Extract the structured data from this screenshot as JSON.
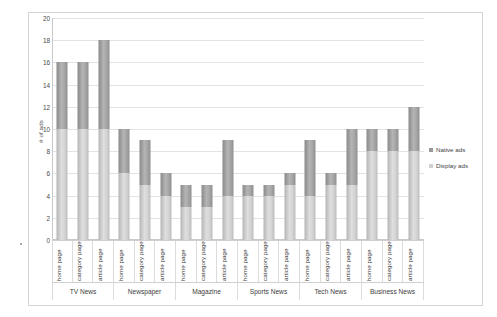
{
  "chart_data": {
    "type": "bar",
    "subtype": "stacked-bar-grouped",
    "title": "",
    "xlabel": "",
    "ylabel": "# of ads",
    "ylim": [
      0,
      20
    ],
    "yticks": [
      0,
      2,
      4,
      6,
      8,
      10,
      12,
      14,
      16,
      18,
      20
    ],
    "grid": true,
    "legend_position": "right",
    "categories": [
      "home page",
      "category page",
      "article page",
      "home page",
      "category page",
      "article page",
      "home page",
      "category page",
      "article page",
      "home page",
      "category page",
      "article page",
      "home page",
      "category page",
      "article page",
      "home page",
      "category page",
      "article page"
    ],
    "groups": [
      {
        "name": "TV News",
        "span": 3
      },
      {
        "name": "Newspaper",
        "span": 3
      },
      {
        "name": "Magazine",
        "span": 3
      },
      {
        "name": "Sports News",
        "span": 3
      },
      {
        "name": "Tech News",
        "span": 3
      },
      {
        "name": "Business News",
        "span": 3
      }
    ],
    "series": [
      {
        "name": "Display ads",
        "color": "#d0d0d0",
        "values": [
          10,
          10,
          10,
          6,
          5,
          4,
          3,
          3,
          4,
          4,
          4,
          5,
          4,
          5,
          5,
          8,
          8,
          8
        ]
      },
      {
        "name": "Native ads",
        "color": "#9a9a9a",
        "values": [
          6,
          6,
          8,
          4,
          4,
          2,
          2,
          2,
          5,
          1,
          1,
          1,
          5,
          1,
          5,
          2,
          2,
          4
        ]
      }
    ],
    "totals": [
      16,
      16,
      18,
      10,
      9,
      6,
      5,
      5,
      9,
      5,
      5,
      6,
      9,
      6,
      10,
      10,
      10,
      12
    ]
  },
  "legend": {
    "items": [
      {
        "label": "Native ads",
        "color": "#9a9a9a"
      },
      {
        "label": "Display ads",
        "color": "#d0d0d0"
      }
    ]
  }
}
